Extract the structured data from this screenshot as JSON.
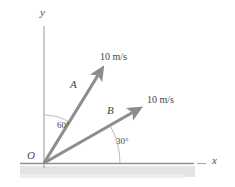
{
  "figure": {
    "type": "vector-diagram",
    "background_color": "#ffffff",
    "axes": {
      "x_label": "x",
      "y_label": "y",
      "origin_label": "O",
      "axis_color": "#9d9d9d",
      "x_axis": {
        "x1": 20,
        "y1": 163,
        "x2": 206,
        "y2": 163
      },
      "y_axis": {
        "x1": 44,
        "y1": 26,
        "x2": 44,
        "y2": 168
      },
      "x_label_pos": {
        "x": 213,
        "y": 159
      },
      "y_label_pos": {
        "x": 40,
        "y": 8
      },
      "origin_label_pos": {
        "x": 28,
        "y": 152
      }
    },
    "ground": {
      "name": "ground-band",
      "color": "#e2e2e2",
      "x": 20,
      "y": 166,
      "width": 175,
      "height": 11
    },
    "vectors": [
      {
        "id": "A",
        "label": "A",
        "magnitude_label": "10 m/s",
        "angle_from_y_axis_deg": 60,
        "angle_from_x_axis_deg": 60,
        "color": "#8d8d8d",
        "tail": {
          "x": 44,
          "y": 163
        },
        "tip": {
          "x": 104,
          "y": 66
        },
        "label_pos": {
          "x": 70,
          "y": 80
        },
        "magnitude_label_pos": {
          "x": 100,
          "y": 52
        }
      },
      {
        "id": "B",
        "label": "B",
        "magnitude_label": "10 m/s",
        "angle_from_x_axis_deg": 30,
        "color": "#8d8d8d",
        "tail": {
          "x": 44,
          "y": 163
        },
        "tip": {
          "x": 141,
          "y": 108
        },
        "label_pos": {
          "x": 107,
          "y": 106
        },
        "magnitude_label_pos": {
          "x": 148,
          "y": 95
        }
      }
    ],
    "angles": [
      {
        "id": "angle-60",
        "label": "60°",
        "value": 60,
        "unit": "degrees",
        "measured_from": "y-axis",
        "measured_to": "vector-A",
        "arc_radius": 48,
        "arc_color": "#b5b5b5",
        "label_pos": {
          "x": 57,
          "y": 122
        }
      },
      {
        "id": "angle-30",
        "label": "30°",
        "value": 30,
        "unit": "degrees",
        "measured_from": "x-axis",
        "measured_to": "vector-B",
        "arc_radius": 76,
        "arc_color": "#b5b5b5",
        "label_pos": {
          "x": 116,
          "y": 138
        }
      }
    ]
  }
}
